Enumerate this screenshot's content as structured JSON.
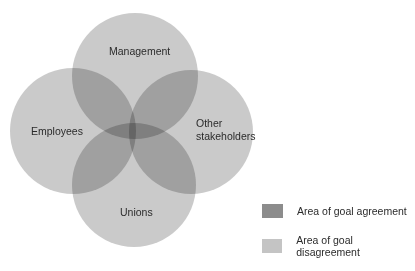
{
  "diagram": {
    "type": "venn",
    "sets": [
      {
        "name": "Management"
      },
      {
        "name": "Employees"
      },
      {
        "name": "Other stakeholders",
        "lines": [
          "Other",
          "stakeholders"
        ]
      },
      {
        "name": "Unions"
      }
    ]
  },
  "labels": {
    "management": "Management",
    "employees": "Employees",
    "other_line1": "Other",
    "other_line2": "stakeholders",
    "unions": "Unions"
  },
  "legend": {
    "items": [
      {
        "label": "Area of goal agreement",
        "color": "#8c8c8c"
      },
      {
        "label": "Area of goal disagreement",
        "color": "#c4c4c4"
      }
    ]
  }
}
